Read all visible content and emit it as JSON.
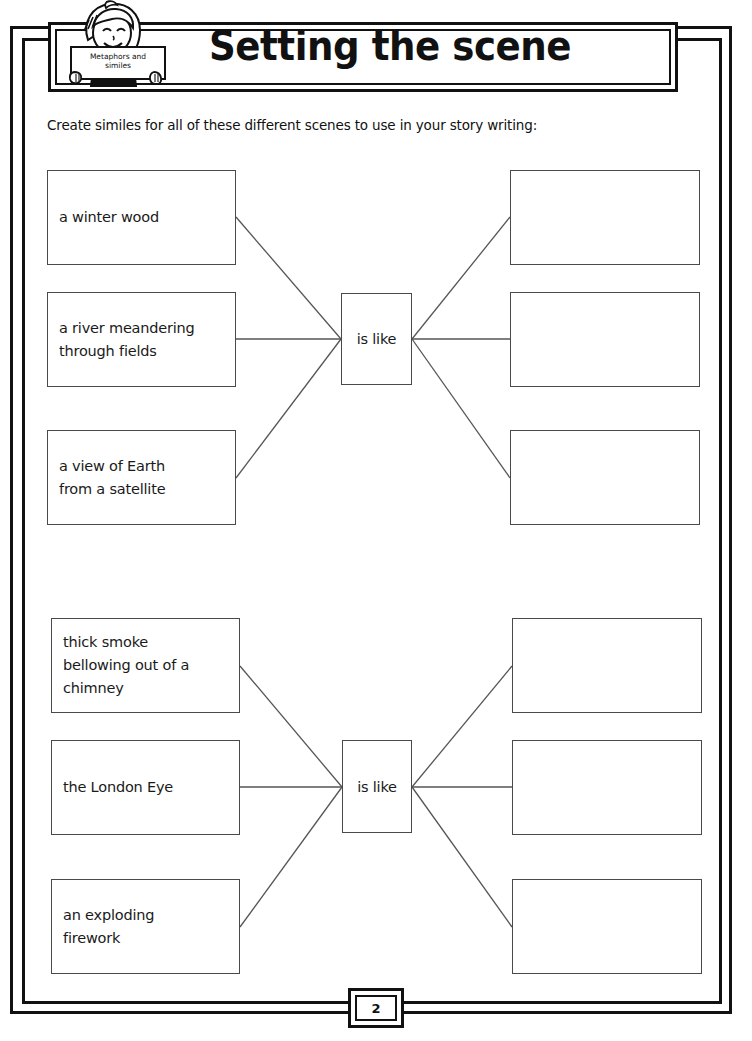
{
  "header": {
    "title": "Setting the scene",
    "mascot_sign_label": "Metaphors and\nsimiles",
    "mascot_icon": "girl-holding-sign-icon"
  },
  "instruction": "Create similes for all of these different scenes to use in your story writing:",
  "groups": [
    {
      "hub_label": "is like",
      "prompts": [
        "a winter wood",
        "a river meandering\nthrough fields",
        "a view of Earth\nfrom a satellite"
      ],
      "answers": [
        "",
        "",
        ""
      ]
    },
    {
      "hub_label": "is like",
      "prompts": [
        "thick smoke\nbellowing out of a\nchimney",
        "the London Eye",
        "an exploding\nfirework"
      ],
      "answers": [
        "",
        "",
        ""
      ]
    }
  ],
  "footer": {
    "page_number": "2",
    "cropped_note": ""
  },
  "colors": {
    "frame": "#111111",
    "box_stroke": "#4a4a4a",
    "connector": "#555555",
    "text": "#111111",
    "paper": "#ffffff"
  }
}
